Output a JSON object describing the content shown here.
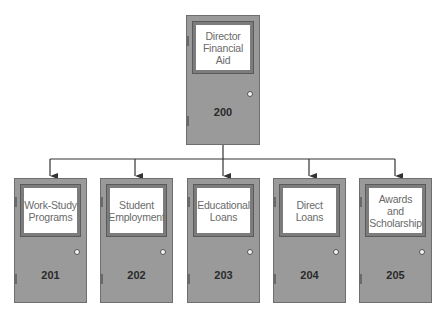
{
  "chart": {
    "root": {
      "title": "Director\nFinancial\nAid",
      "number": "200"
    },
    "children": [
      {
        "title": "Work-Study\nPrograms",
        "number": "201"
      },
      {
        "title": "Student\nEmployment",
        "number": "202"
      },
      {
        "title": "Educational\nLoans",
        "number": "203"
      },
      {
        "title": "Direct\nLoans",
        "number": "204"
      },
      {
        "title": "Awards\nand\nScholarship",
        "number": "205"
      }
    ]
  },
  "colors": {
    "door": "#9a9a9a",
    "frame": "#7c7c7c",
    "sign": "#ffffff",
    "line": "#333333"
  }
}
